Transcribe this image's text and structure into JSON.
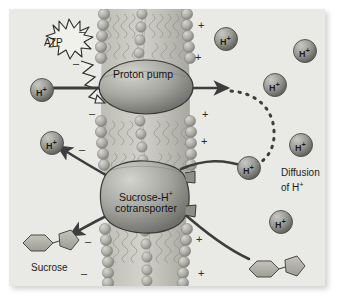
{
  "figure": {
    "panel_background": "#e9e9e6",
    "ink_color": "#3d3d3d"
  },
  "labels": {
    "atp": "ATP",
    "proton_pump": "Proton pump",
    "cotransporter_line1": "Sucrose-H",
    "cotransporter_sup": "+",
    "cotransporter_line2": "cotransporter",
    "diffusion_line1": "Diffusion",
    "diffusion_line2_prefix": "of H",
    "diffusion_line2_sup": "+",
    "sucrose_left": "Sucrose",
    "sucrose_right": "Sucrose",
    "proton_symbol": "H",
    "proton_charge": "+",
    "minus_sign": "–",
    "plus_sign": "+"
  },
  "membrane": {
    "description": "phospholipid bilayer",
    "head_color": "#a9a9a4",
    "tail_color": "#b9b9b2",
    "inner_side": "cytoplasm (negative)",
    "outer_side": "cell wall / apoplast (positive)"
  },
  "proteins": [
    {
      "name": "proton-pump",
      "shape": "ellipse",
      "cx": 137,
      "cy": 78,
      "rx": 47,
      "ry": 27
    },
    {
      "name": "sucrose-h-cotransporter",
      "shape": "blob",
      "cx": 136,
      "cy": 190,
      "rx": 44,
      "ry": 28
    }
  ],
  "protons": [
    {
      "id": "h-inner-upper",
      "x": 33,
      "y": 90,
      "r": 12,
      "side": "inner"
    },
    {
      "id": "h-inner-lower",
      "x": 43,
      "y": 143,
      "r": 12,
      "side": "inner"
    },
    {
      "id": "h-outer-1",
      "x": 215,
      "y": 28,
      "r": 12,
      "side": "outer"
    },
    {
      "id": "h-outer-2",
      "x": 293,
      "y": 38,
      "r": 12,
      "side": "outer"
    },
    {
      "id": "h-outer-3",
      "x": 272,
      "y": 72,
      "r": 12,
      "side": "outer"
    },
    {
      "id": "h-outer-4",
      "x": 290,
      "y": 143,
      "r": 12,
      "side": "outer"
    },
    {
      "id": "h-outer-diffusing",
      "x": 249,
      "y": 165,
      "r": 12,
      "side": "outer"
    },
    {
      "id": "h-outer-6",
      "x": 275,
      "y": 217,
      "r": 12,
      "side": "outer"
    }
  ],
  "sucrose_molecules": [
    {
      "id": "sucrose-inner",
      "x": 22,
      "y": 228,
      "orientation": "hexagon-pentagon"
    },
    {
      "id": "sucrose-outer",
      "x": 248,
      "y": 254,
      "orientation": "hexagon-pentagon"
    }
  ],
  "charges": {
    "inner_minus": [
      {
        "x": 72,
        "y": 24
      },
      {
        "x": 66,
        "y": 55
      },
      {
        "x": 82,
        "y": 103
      },
      {
        "x": 72,
        "y": 140
      },
      {
        "x": 78,
        "y": 230
      },
      {
        "x": 74,
        "y": 262
      }
    ],
    "outer_plus": [
      {
        "x": 190,
        "y": 18
      },
      {
        "x": 187,
        "y": 50
      },
      {
        "x": 194,
        "y": 105
      },
      {
        "x": 193,
        "y": 132
      },
      {
        "x": 188,
        "y": 228
      },
      {
        "x": 190,
        "y": 262
      }
    ]
  },
  "arrows": [
    {
      "name": "proton-pump-inflow",
      "from": "h-inner-upper",
      "to": "proton-pump",
      "style": "solid"
    },
    {
      "name": "proton-pump-outflow",
      "from": "proton-pump",
      "to": "outer-space",
      "style": "solid"
    },
    {
      "name": "proton-diffusion",
      "from": "outer-space",
      "to": "h-outer-diffusing",
      "style": "dashed"
    },
    {
      "name": "cotransport-proton-in",
      "from": "h-outer-diffusing",
      "to": "cotransporter",
      "style": "solid-curve"
    },
    {
      "name": "cotransport-proton-release",
      "from": "cotransporter",
      "to": "h-inner-lower",
      "style": "solid-curve"
    },
    {
      "name": "cotransport-sucrose-in",
      "from": "sucrose-outer",
      "to": "cotransporter",
      "style": "solid-curve"
    },
    {
      "name": "cotransport-sucrose-release",
      "from": "cotransporter",
      "to": "sucrose-inner",
      "style": "solid-curve"
    },
    {
      "name": "atp-energy",
      "from": "atp",
      "to": "proton-pump",
      "style": "zigzag"
    }
  ]
}
